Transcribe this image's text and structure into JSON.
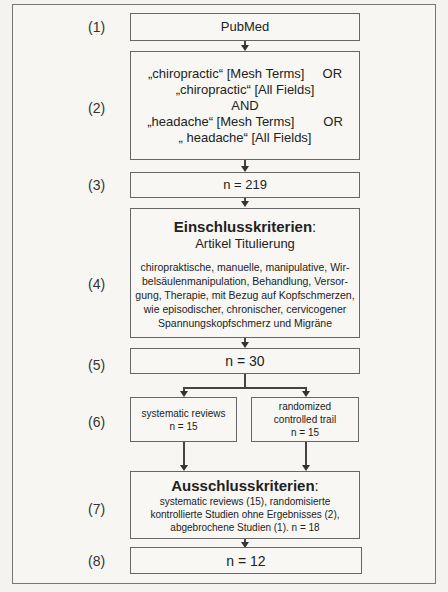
{
  "steps": [
    {
      "label": "(1)",
      "lines": [
        "PubMed"
      ]
    },
    {
      "label": "(2)",
      "lines": [
        "„chiropractic“ [Mesh Terms]     OR",
        "„chiropractic“ [All Fields]",
        "AND",
        "„headache“ [Mesh Terms]        OR",
        "„ headache“ [All Fields]"
      ]
    },
    {
      "label": "(3)",
      "lines": [
        "n = 219"
      ]
    },
    {
      "label": "(4)",
      "title": "Einschlusskriterien",
      "title_suffix": ":",
      "subtitle": "Artikel Titulierung",
      "lines": [
        "chiropraktische, manuelle, manipulative, Wir-",
        "belsäulenmanipulation, Behandlung, Versor-",
        "gung, Therapie, mit Bezug auf Kopfschmerzen,",
        "wie episodischer, chronischer, cervicogener",
        "Spannungskopfschmerz und Migräne"
      ]
    },
    {
      "label": "(5)",
      "lines": [
        "n = 30"
      ]
    },
    {
      "label": "(6)",
      "left": [
        "systematic reviews",
        "n = 15"
      ],
      "right": [
        "randomized",
        "controlled trail",
        "n = 15"
      ]
    },
    {
      "label": "(7)",
      "title": "Ausschlusskriterien",
      "title_suffix": ":",
      "lines": [
        "systematic reviews (15), randomisierte",
        "kontrollierte Studien ohne Ergebnisses (2),",
        "abgebrochene Studien (1). n = 18"
      ]
    },
    {
      "label": "(8)",
      "lines": [
        "n = 12"
      ]
    }
  ]
}
